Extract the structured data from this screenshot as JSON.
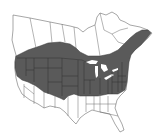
{
  "map": {
    "type": "species-range-map",
    "region": "North America (Canada and United States)",
    "colors": {
      "background": "#ffffff",
      "land": "#ffffff",
      "outline": "#6b6b6b",
      "range_fill": "#5a5a5a",
      "range_border": "#2e2e2e"
    },
    "range_description": "Shaded range spans southern Canada and the northern and central United States, from the Pacific Northwest east to the Atlantic coast and Newfoundland; the southwestern and southeastern US are unshaded."
  }
}
